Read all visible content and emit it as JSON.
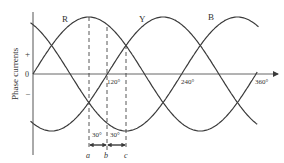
{
  "diagram": {
    "y_axis_label": "Phase currents",
    "y_ticks": {
      "plus": "+",
      "zero": "0",
      "minus": "–"
    },
    "x_ticks": [
      "120°",
      "240°",
      "360°"
    ],
    "curves": [
      {
        "name": "R",
        "phase_deg": 0
      },
      {
        "name": "Y",
        "phase_deg": 120
      },
      {
        "name": "B",
        "phase_deg": 240
      }
    ],
    "intervals": [
      {
        "label": "30°"
      },
      {
        "label": "30°"
      }
    ],
    "points": [
      "a",
      "b",
      "c"
    ],
    "colors": {
      "line": "#3a3a3a",
      "background": "#ffffff"
    }
  }
}
